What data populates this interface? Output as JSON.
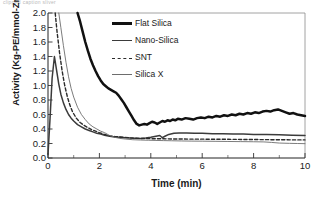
{
  "top_artifact": "clipped caption sliver",
  "axes": {
    "xlabel": "Time (min)",
    "ylabel": "Activity (Kg-PE/mmol-Zr.min)",
    "xticks": [
      "0",
      "2",
      "4",
      "6",
      "8",
      "10"
    ],
    "yticks": [
      "2.0",
      "1.8",
      "1.6",
      "1.4",
      "1.2",
      "1.0",
      "0.8",
      "0.6",
      "0.4",
      "0.2",
      "0.0"
    ]
  },
  "legend": {
    "items": [
      {
        "label": "Flat Silica",
        "style": "thick-solid",
        "color": "#111111"
      },
      {
        "label": "Nano-Silica",
        "style": "medium-solid",
        "color": "#3b3b3b"
      },
      {
        "label": "SNT",
        "style": "dashed",
        "color": "#2b2b2b"
      },
      {
        "label": "Silica X",
        "style": "thin-solid",
        "color": "#6d6d6d"
      }
    ]
  },
  "chart_data": {
    "type": "line",
    "title": "",
    "xlabel": "Time (min)",
    "ylabel": "Activity (Kg-PE/mmol-Zr.min)",
    "xlim": [
      0,
      10
    ],
    "ylim": [
      0,
      2.0
    ],
    "xtick_step": 2,
    "xminor_tick_step": 1,
    "ytick_step": 0.2,
    "grid": false,
    "legend_position": "upper-center-right",
    "note": "Curves are clipped at the y-axis top (2.0); Flat Silica, SNT and Silica X enter the frame from above 2.0.",
    "series": [
      {
        "name": "Flat Silica",
        "style": "thick-solid",
        "color": "#111111",
        "x": [
          1.15,
          1.25,
          1.35,
          1.45,
          1.55,
          1.65,
          1.75,
          1.85,
          1.95,
          2.05,
          2.15,
          2.25,
          2.35,
          2.45,
          2.55,
          2.65,
          2.75,
          2.85,
          2.95,
          3.05,
          3.15,
          3.25,
          3.35,
          3.45,
          3.55,
          3.65,
          3.75,
          3.85,
          3.95,
          4.05,
          4.15,
          4.25,
          4.35,
          4.45,
          4.55,
          4.65,
          4.75,
          4.85,
          4.95,
          5.05,
          5.2,
          5.35,
          5.5,
          5.65,
          5.8,
          5.95,
          6.1,
          6.25,
          6.4,
          6.55,
          6.7,
          6.85,
          7.0,
          7.15,
          7.3,
          7.45,
          7.6,
          7.75,
          7.9,
          8.05,
          8.2,
          8.35,
          8.5,
          8.65,
          8.8,
          8.95,
          9.1,
          9.25,
          9.4,
          9.55,
          9.7,
          9.85,
          10.0
        ],
        "y": [
          2.0,
          1.88,
          1.74,
          1.6,
          1.48,
          1.37,
          1.28,
          1.2,
          1.13,
          1.07,
          1.02,
          0.99,
          0.96,
          0.94,
          0.92,
          0.9,
          0.86,
          0.81,
          0.76,
          0.7,
          0.64,
          0.58,
          0.52,
          0.47,
          0.45,
          0.46,
          0.47,
          0.46,
          0.48,
          0.5,
          0.49,
          0.47,
          0.49,
          0.51,
          0.5,
          0.52,
          0.51,
          0.53,
          0.52,
          0.54,
          0.53,
          0.55,
          0.54,
          0.53,
          0.55,
          0.56,
          0.55,
          0.57,
          0.56,
          0.58,
          0.57,
          0.59,
          0.58,
          0.6,
          0.59,
          0.61,
          0.6,
          0.62,
          0.61,
          0.63,
          0.62,
          0.64,
          0.65,
          0.64,
          0.66,
          0.67,
          0.65,
          0.63,
          0.61,
          0.62,
          0.6,
          0.59,
          0.58
        ]
      },
      {
        "name": "Nano-Silica",
        "style": "medium-solid",
        "color": "#3b3b3b",
        "x": [
          0.0,
          0.08,
          0.16,
          0.25,
          0.33,
          0.42,
          0.5,
          0.6,
          0.7,
          0.8,
          0.9,
          1.0,
          1.15,
          1.3,
          1.45,
          1.6,
          1.75,
          1.9,
          2.05,
          2.2,
          2.4,
          2.6,
          2.8,
          3.0,
          3.2,
          3.4,
          3.6,
          3.8,
          4.0,
          4.2,
          4.35,
          4.45,
          4.55,
          4.7,
          4.9,
          5.1,
          5.4,
          5.7,
          6.0,
          6.4,
          6.8,
          7.2,
          7.6,
          8.0,
          8.5,
          9.0,
          9.5,
          10.0
        ],
        "y": [
          0.05,
          0.55,
          1.1,
          1.4,
          1.22,
          1.02,
          0.88,
          0.76,
          0.67,
          0.6,
          0.55,
          0.51,
          0.46,
          0.43,
          0.4,
          0.38,
          0.36,
          0.34,
          0.33,
          0.315,
          0.3,
          0.29,
          0.285,
          0.28,
          0.275,
          0.272,
          0.27,
          0.275,
          0.285,
          0.3,
          0.31,
          0.28,
          0.3,
          0.325,
          0.34,
          0.345,
          0.345,
          0.34,
          0.34,
          0.335,
          0.335,
          0.33,
          0.33,
          0.325,
          0.325,
          0.32,
          0.315,
          0.31
        ]
      },
      {
        "name": "SNT",
        "style": "dashed",
        "color": "#2b2b2b",
        "x": [
          0.28,
          0.35,
          0.45,
          0.55,
          0.65,
          0.75,
          0.85,
          0.95,
          1.1,
          1.25,
          1.4,
          1.55,
          1.7,
          1.85,
          2.0,
          2.2,
          2.4,
          2.6,
          2.8,
          3.0,
          3.3,
          3.6,
          3.9,
          4.2,
          4.5,
          4.8,
          5.2,
          5.6,
          6.0,
          6.5,
          7.0,
          7.5,
          8.0,
          8.5,
          9.0,
          9.5,
          10.0
        ],
        "y": [
          2.0,
          1.75,
          1.45,
          1.2,
          1.0,
          0.85,
          0.73,
          0.64,
          0.55,
          0.49,
          0.45,
          0.42,
          0.39,
          0.37,
          0.35,
          0.325,
          0.305,
          0.295,
          0.29,
          0.285,
          0.275,
          0.27,
          0.268,
          0.265,
          0.265,
          0.263,
          0.262,
          0.26,
          0.26,
          0.258,
          0.258,
          0.256,
          0.255,
          0.253,
          0.252,
          0.25,
          0.25
        ]
      },
      {
        "name": "Silica X",
        "style": "thin-solid",
        "color": "#6d6d6d",
        "x": [
          0.42,
          0.5,
          0.6,
          0.7,
          0.8,
          0.9,
          1.0,
          1.15,
          1.3,
          1.45,
          1.6,
          1.75,
          1.9,
          2.05,
          2.2,
          2.4,
          2.6,
          2.8,
          3.0,
          3.3,
          3.6,
          3.9,
          4.2,
          4.5,
          4.8,
          5.2,
          5.6,
          6.0,
          6.5,
          7.0,
          7.5,
          8.0,
          8.4,
          8.7,
          9.0,
          9.4,
          9.7,
          10.0
        ],
        "y": [
          2.0,
          1.8,
          1.55,
          1.32,
          1.12,
          0.96,
          0.84,
          0.7,
          0.6,
          0.53,
          0.47,
          0.43,
          0.4,
          0.37,
          0.35,
          0.31,
          0.285,
          0.27,
          0.262,
          0.252,
          0.248,
          0.245,
          0.242,
          0.24,
          0.238,
          0.235,
          0.233,
          0.232,
          0.23,
          0.228,
          0.226,
          0.224,
          0.222,
          0.215,
          0.206,
          0.202,
          0.2,
          0.198
        ]
      }
    ]
  }
}
